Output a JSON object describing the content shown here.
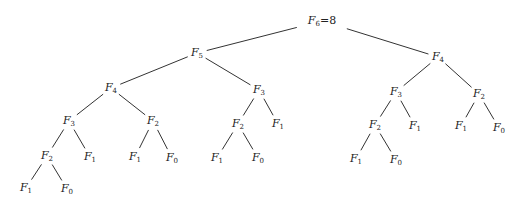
{
  "diagram": {
    "edge_color": "#333333",
    "nodes": [
      {
        "id": "n0",
        "label": "F",
        "sub": "6",
        "suffix": "=8",
        "parent": null
      },
      {
        "id": "n1",
        "label": "F",
        "sub": "5",
        "parent": "n0"
      },
      {
        "id": "n2",
        "label": "F",
        "sub": "4",
        "parent": "n0"
      },
      {
        "id": "n3",
        "label": "F",
        "sub": "4",
        "parent": "n1"
      },
      {
        "id": "n4",
        "label": "F",
        "sub": "3",
        "parent": "n1"
      },
      {
        "id": "n5",
        "label": "F",
        "sub": "3",
        "parent": "n2"
      },
      {
        "id": "n6",
        "label": "F",
        "sub": "2",
        "parent": "n2"
      },
      {
        "id": "n7",
        "label": "F",
        "sub": "3",
        "parent": "n3"
      },
      {
        "id": "n8",
        "label": "F",
        "sub": "2",
        "parent": "n3"
      },
      {
        "id": "n9",
        "label": "F",
        "sub": "2",
        "parent": "n4"
      },
      {
        "id": "n10",
        "label": "F",
        "sub": "1",
        "parent": "n4"
      },
      {
        "id": "n11",
        "label": "F",
        "sub": "2",
        "parent": "n5"
      },
      {
        "id": "n12",
        "label": "F",
        "sub": "1",
        "parent": "n5"
      },
      {
        "id": "n13",
        "label": "F",
        "sub": "1",
        "parent": "n6"
      },
      {
        "id": "n14",
        "label": "F",
        "sub": "0",
        "parent": "n6"
      },
      {
        "id": "n15",
        "label": "F",
        "sub": "2",
        "parent": "n7"
      },
      {
        "id": "n16",
        "label": "F",
        "sub": "1",
        "parent": "n7"
      },
      {
        "id": "n17",
        "label": "F",
        "sub": "1",
        "parent": "n8"
      },
      {
        "id": "n18",
        "label": "F",
        "sub": "0",
        "parent": "n8"
      },
      {
        "id": "n19",
        "label": "F",
        "sub": "1",
        "parent": "n9"
      },
      {
        "id": "n20",
        "label": "F",
        "sub": "0",
        "parent": "n9"
      },
      {
        "id": "n21",
        "label": "F",
        "sub": "1",
        "parent": "n11"
      },
      {
        "id": "n22",
        "label": "F",
        "sub": "0",
        "parent": "n11"
      },
      {
        "id": "n23",
        "label": "F",
        "sub": "1",
        "parent": "n15"
      },
      {
        "id": "n24",
        "label": "F",
        "sub": "0",
        "parent": "n15"
      }
    ]
  }
}
